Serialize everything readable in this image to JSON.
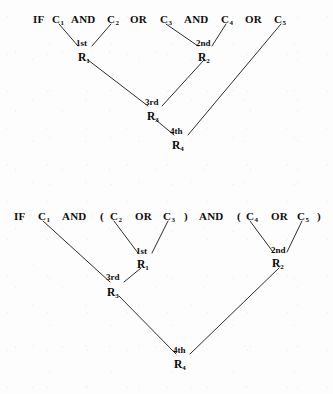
{
  "figure": {
    "background_color": "#fdfdfd",
    "ink_color": "#0d0d0d"
  },
  "diagrams": [
    {
      "id": "diagram-without-parentheses",
      "expression_tokens": [
        {
          "text": "IF",
          "x": 33,
          "y": 14
        },
        {
          "text": "C",
          "sub": "1",
          "x": 52,
          "y": 14
        },
        {
          "text": "AND",
          "x": 71,
          "y": 14
        },
        {
          "text": "C",
          "sub": "2",
          "x": 107,
          "y": 14
        },
        {
          "text": "OR",
          "x": 130,
          "y": 14
        },
        {
          "text": "C",
          "sub": "3",
          "x": 160,
          "y": 14
        },
        {
          "text": "AND",
          "x": 184,
          "y": 14
        },
        {
          "text": "C",
          "sub": "4",
          "x": 221,
          "y": 14
        },
        {
          "text": "OR",
          "x": 245,
          "y": 14
        },
        {
          "text": "C",
          "sub": "5",
          "x": 274,
          "y": 14
        }
      ],
      "order_labels": [
        {
          "text": "1st",
          "x": 76,
          "y": 39
        },
        {
          "text": "2nd",
          "x": 196,
          "y": 39
        },
        {
          "text": "3rd",
          "x": 145,
          "y": 98
        },
        {
          "text": "4th",
          "x": 170,
          "y": 127
        }
      ],
      "result_nodes": [
        {
          "text": "R",
          "sub": "1",
          "x": 78,
          "y": 52
        },
        {
          "text": "R",
          "sub": "2",
          "x": 198,
          "y": 52
        },
        {
          "text": "R",
          "sub": "3",
          "x": 147,
          "y": 111
        },
        {
          "text": "R",
          "sub": "4",
          "x": 172,
          "y": 140
        }
      ],
      "edges": [
        {
          "from": "C1",
          "to": "R1",
          "x1": 59,
          "y1": 24,
          "x2": 78,
          "y2": 46
        },
        {
          "from": "C2",
          "to": "R1",
          "x1": 111,
          "y1": 24,
          "x2": 92,
          "y2": 46
        },
        {
          "from": "C3",
          "to": "R2",
          "x1": 166,
          "y1": 24,
          "x2": 198,
          "y2": 46
        },
        {
          "from": "C4",
          "to": "R2",
          "x1": 226,
          "y1": 24,
          "x2": 212,
          "y2": 46
        },
        {
          "from": "R1",
          "to": "R3",
          "x1": 88,
          "y1": 60,
          "x2": 148,
          "y2": 106
        },
        {
          "from": "R2",
          "to": "R3",
          "x1": 204,
          "y1": 60,
          "x2": 162,
          "y2": 106
        },
        {
          "from": "R3",
          "to": "R4",
          "x1": 156,
          "y1": 120,
          "x2": 174,
          "y2": 135
        },
        {
          "from": "C5",
          "to": "R4",
          "x1": 281,
          "y1": 24,
          "x2": 188,
          "y2": 135
        }
      ]
    },
    {
      "id": "diagram-with-parentheses",
      "expression_tokens": [
        {
          "text": "IF",
          "x": 14,
          "y": 211
        },
        {
          "text": "C",
          "sub": "1",
          "x": 38,
          "y": 211
        },
        {
          "text": "AND",
          "x": 62,
          "y": 211
        },
        {
          "text": "(",
          "x": 100,
          "y": 211
        },
        {
          "text": "C",
          "sub": "2",
          "x": 110,
          "y": 211
        },
        {
          "text": "OR",
          "x": 135,
          "y": 211
        },
        {
          "text": "C",
          "sub": "3",
          "x": 163,
          "y": 211
        },
        {
          "text": ")",
          "x": 184,
          "y": 211
        },
        {
          "text": "AND",
          "x": 199,
          "y": 211
        },
        {
          "text": "(",
          "x": 237,
          "y": 211
        },
        {
          "text": "C",
          "sub": "4",
          "x": 246,
          "y": 211
        },
        {
          "text": "OR",
          "x": 271,
          "y": 211
        },
        {
          "text": "C",
          "sub": "5",
          "x": 297,
          "y": 211
        },
        {
          "text": ")",
          "x": 317,
          "y": 211
        }
      ],
      "order_labels": [
        {
          "text": "1st",
          "x": 136,
          "y": 247
        },
        {
          "text": "2nd",
          "x": 271,
          "y": 246
        },
        {
          "text": "3rd",
          "x": 106,
          "y": 273
        },
        {
          "text": "4th",
          "x": 173,
          "y": 346
        }
      ],
      "result_nodes": [
        {
          "text": "R",
          "sub": "1",
          "x": 137,
          "y": 259
        },
        {
          "text": "R",
          "sub": "2",
          "x": 272,
          "y": 258
        },
        {
          "text": "R",
          "sub": "3",
          "x": 107,
          "y": 287
        },
        {
          "text": "R",
          "sub": "4",
          "x": 174,
          "y": 359
        }
      ],
      "edges": [
        {
          "from": "C2",
          "to": "R1",
          "x1": 114,
          "y1": 221,
          "x2": 138,
          "y2": 253
        },
        {
          "from": "C3",
          "to": "R1",
          "x1": 168,
          "y1": 221,
          "x2": 152,
          "y2": 253
        },
        {
          "from": "C4",
          "to": "R2",
          "x1": 250,
          "y1": 221,
          "x2": 273,
          "y2": 252
        },
        {
          "from": "C5",
          "to": "R2",
          "x1": 302,
          "y1": 221,
          "x2": 287,
          "y2": 252
        },
        {
          "from": "C1",
          "to": "R3",
          "x1": 43,
          "y1": 221,
          "x2": 110,
          "y2": 282
        },
        {
          "from": "R1",
          "to": "R3",
          "x1": 141,
          "y1": 268,
          "x2": 124,
          "y2": 282
        },
        {
          "from": "R3",
          "to": "R4",
          "x1": 119,
          "y1": 296,
          "x2": 176,
          "y2": 354
        },
        {
          "from": "R2",
          "to": "R4",
          "x1": 279,
          "y1": 268,
          "x2": 190,
          "y2": 354
        }
      ]
    }
  ]
}
